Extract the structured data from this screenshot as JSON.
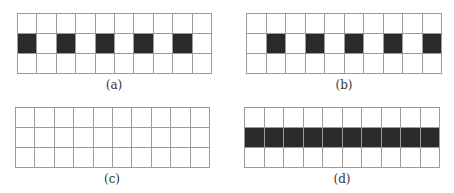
{
  "figure": {
    "rows": 3,
    "cols": 10,
    "colors": {
      "grid_line": "#9a9a9a",
      "filled_cell": "#2a2a2a",
      "empty_cell": "#ffffff"
    },
    "panels": [
      {
        "id": "a",
        "caption": "(a)",
        "filled": [
          [
            1,
            0
          ],
          [
            1,
            2
          ],
          [
            1,
            4
          ],
          [
            1,
            6
          ],
          [
            1,
            8
          ]
        ],
        "box": {
          "left": 17,
          "top": 13,
          "width": 195,
          "height": 61
        },
        "caption_pos": {
          "left": 94,
          "top": 78
        }
      },
      {
        "id": "b",
        "caption": "(b)",
        "filled": [
          [
            1,
            1
          ],
          [
            1,
            3
          ],
          [
            1,
            5
          ],
          [
            1,
            7
          ],
          [
            1,
            9
          ]
        ],
        "box": {
          "left": 246,
          "top": 13,
          "width": 196,
          "height": 61
        },
        "caption_pos": {
          "left": 324,
          "top": 78
        }
      },
      {
        "id": "c",
        "caption": "(c)",
        "filled": [],
        "box": {
          "left": 15,
          "top": 107,
          "width": 195,
          "height": 61
        },
        "caption_pos": {
          "left": 92,
          "top": 172
        }
      },
      {
        "id": "d",
        "caption": "(d)",
        "filled": [
          [
            1,
            0
          ],
          [
            1,
            1
          ],
          [
            1,
            2
          ],
          [
            1,
            3
          ],
          [
            1,
            4
          ],
          [
            1,
            5
          ],
          [
            1,
            6
          ],
          [
            1,
            7
          ],
          [
            1,
            8
          ],
          [
            1,
            9
          ]
        ],
        "box": {
          "left": 244,
          "top": 107,
          "width": 196,
          "height": 61
        },
        "caption_pos": {
          "left": 322,
          "top": 172
        }
      }
    ]
  }
}
